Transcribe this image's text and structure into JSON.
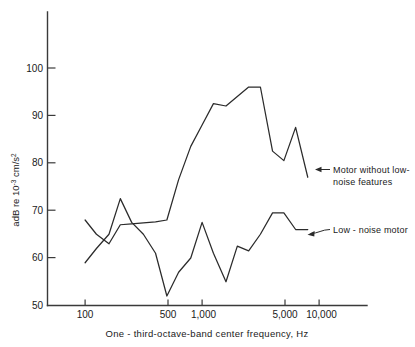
{
  "chart_data": {
    "type": "line",
    "title": "",
    "subtitle": "",
    "xlabel": "One - third-octave-band center frequency, Hz",
    "ylabel": "adB re 10-3 cm/s2",
    "ylabel_parts": {
      "prefix": "adB re 10",
      "exponent": "-3",
      "mid": " cm/s",
      "exponent2": "2"
    },
    "xscale": "log",
    "yscale": "linear",
    "xlim": [
      80,
      13000
    ],
    "ylim": [
      50,
      105
    ],
    "grid": false,
    "legend_position": "inline-annotations",
    "xtick_labels": [
      "100",
      "500",
      "1,000",
      "5,000",
      "10,000"
    ],
    "xtick_values": [
      100,
      500,
      1000,
      5000,
      10000
    ],
    "ytick_labels": [
      "50",
      "60",
      "70",
      "80",
      "90",
      "100"
    ],
    "ytick_values": [
      50,
      60,
      70,
      80,
      90,
      100
    ],
    "series": [
      {
        "name": "Motor without low-noise features",
        "x": [
          100,
          125,
          160,
          200,
          250,
          315,
          400,
          500,
          630,
          800,
          1000,
          1250,
          1600,
          2000,
          2500,
          3150,
          4000,
          5000,
          6300,
          8000
        ],
        "values": [
          68.0,
          65.0,
          63.0,
          67.0,
          67.2,
          67.4,
          67.6,
          68.0,
          76.5,
          83.5,
          88.0,
          92.5,
          92.0,
          94.0,
          96.0,
          96.0,
          82.5,
          80.5,
          87.5,
          77.0
        ]
      },
      {
        "name": "Low-noise motor",
        "x": [
          100,
          125,
          160,
          200,
          250,
          315,
          400,
          500,
          630,
          800,
          1000,
          1250,
          1600,
          2000,
          2500,
          3150,
          4000,
          5000,
          6300,
          8000
        ],
        "values": [
          59.0,
          62.0,
          65.0,
          72.5,
          67.5,
          65.0,
          61.0,
          52.0,
          57.0,
          60.0,
          67.5,
          61.0,
          55.0,
          62.5,
          61.5,
          65.0,
          69.5,
          69.5,
          66.0,
          66.0
        ]
      }
    ],
    "annotations": [
      {
        "id": "upper-annotation",
        "line1": "Motor without low-",
        "line2": "noise features",
        "points_to_series": "Motor without low-noise features"
      },
      {
        "id": "lower-annotation",
        "line1": "Low - noise motor",
        "line2": "",
        "points_to_series": "Low-noise motor"
      }
    ],
    "colors": {
      "curve": "#2b2b2b",
      "axis": "#3a3a3a",
      "text": "#1a1a1a",
      "background": "#ffffff"
    }
  }
}
